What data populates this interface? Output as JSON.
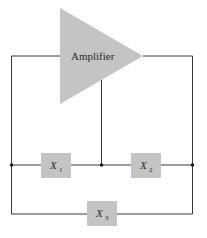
{
  "diagram": {
    "type": "circuit-block-diagram",
    "colors": {
      "block": "#c4c4c4",
      "wire": "#3a3a3a",
      "node": "#1a1a1a",
      "background": "#ffffff"
    },
    "amplifier": {
      "label": "Amplifier"
    },
    "impedances": [
      {
        "id": "X1",
        "symbol": "X",
        "subscript": "1"
      },
      {
        "id": "X2",
        "symbol": "X",
        "subscript": "2"
      },
      {
        "id": "X3",
        "symbol": "X",
        "subscript": "3"
      }
    ]
  }
}
